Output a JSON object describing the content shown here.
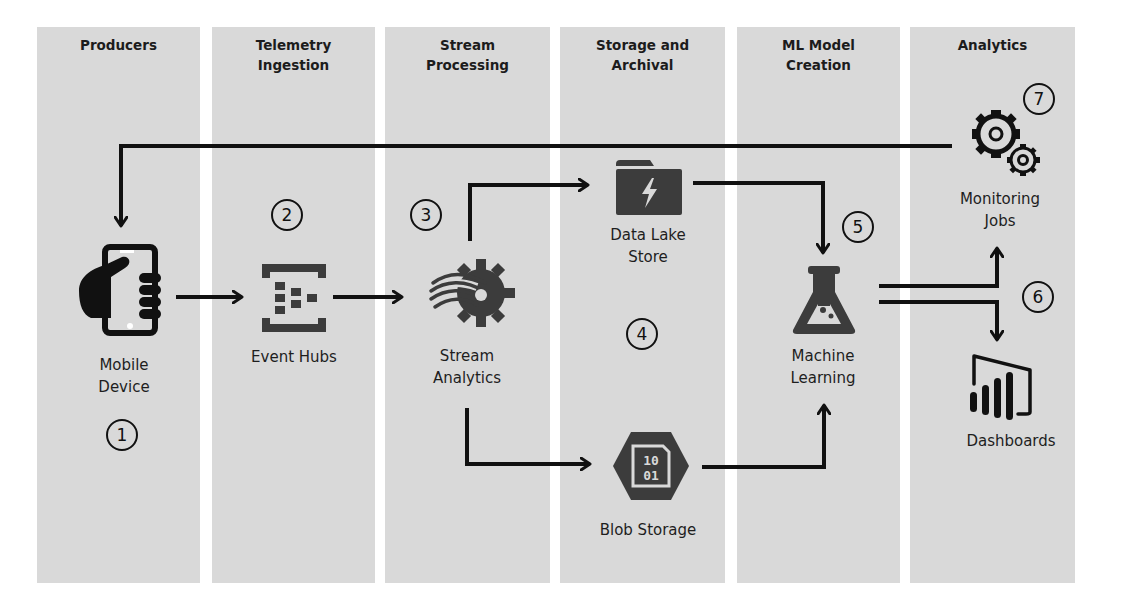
{
  "columns": [
    {
      "id": "producers",
      "title": "Producers"
    },
    {
      "id": "telemetry",
      "title": "Telemetry\nIngestion"
    },
    {
      "id": "stream",
      "title": "Stream\nProcessing"
    },
    {
      "id": "storage",
      "title": "Storage and\nArchival"
    },
    {
      "id": "ml",
      "title": "ML Model\nCreation"
    },
    {
      "id": "analytics",
      "title": "Analytics"
    }
  ],
  "nodes": {
    "mobile": {
      "label": "Mobile\nDevice",
      "icon": "mobile-hand-icon"
    },
    "eventhubs": {
      "label": "Event Hubs",
      "icon": "event-hubs-icon"
    },
    "streamanalytics": {
      "label": "Stream\nAnalytics",
      "icon": "stream-analytics-gear-icon"
    },
    "datalake": {
      "label": "Data Lake\nStore",
      "icon": "data-lake-folder-icon"
    },
    "blob": {
      "label": "Blob Storage",
      "icon": "blob-storage-hexagon-icon",
      "glyph_top": "10",
      "glyph_bottom": "01"
    },
    "ml": {
      "label": "Machine\nLearning",
      "icon": "flask-icon"
    },
    "monitoring": {
      "label": "Monitoring\nJobs",
      "icon": "gears-icon"
    },
    "dashboards": {
      "label": "Dashboards",
      "icon": "power-bi-icon"
    }
  },
  "steps": [
    "1",
    "2",
    "3",
    "4",
    "5",
    "6",
    "7"
  ],
  "colors": {
    "column_bg": "#d9d9d9",
    "icon_fill": "#3c3c3c",
    "line": "#111111",
    "background": "#ffffff"
  }
}
